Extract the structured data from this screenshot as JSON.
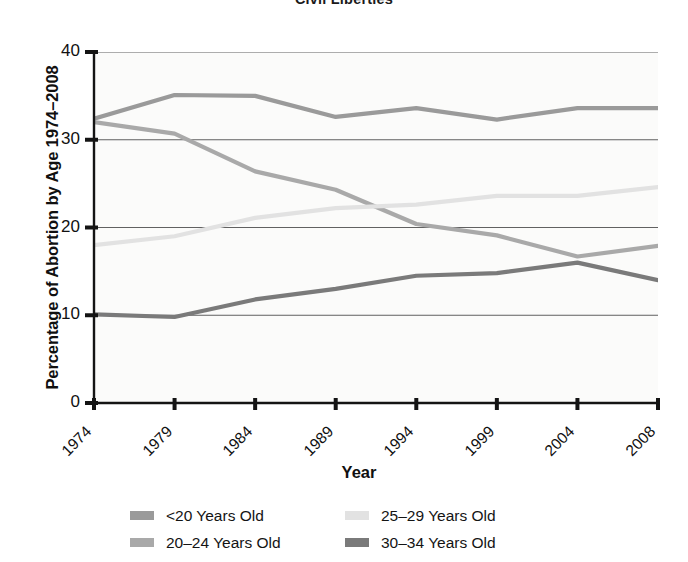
{
  "running_head": "Civil Liberties",
  "axis": {
    "y_title": "Percentage of Abortion by Age 1974–2008",
    "x_title": "Year",
    "y_ticks": [
      "0",
      "10",
      "20",
      "30",
      "40"
    ],
    "x_ticks": [
      "1974",
      "1979",
      "1984",
      "1989",
      "1994",
      "1999",
      "2004",
      "2008"
    ]
  },
  "legend": {
    "items": [
      {
        "label": "<20 Years Old",
        "color": "#9a9a9a"
      },
      {
        "label": "20–24 Years Old",
        "color": "#a9a9a9"
      },
      {
        "label": "25–29 Years Old",
        "color": "#e2e2e2"
      },
      {
        "label": "30–34 Years Old",
        "color": "#7a7a7a"
      }
    ]
  },
  "chart_data": {
    "type": "line",
    "title": "Civil Liberties",
    "xlabel": "Year",
    "ylabel": "Percentage of Abortion by Age 1974–2008",
    "x": [
      1974,
      1979,
      1984,
      1989,
      1994,
      1999,
      2004,
      2008
    ],
    "xlim": [
      1974,
      2008
    ],
    "ylim": [
      0,
      40
    ],
    "yticks": [
      0,
      10,
      20,
      30,
      40
    ],
    "grid": true,
    "grid_axis": "y",
    "legend_position": "bottom",
    "series": [
      {
        "name": "<20 Years Old",
        "color": "#9a9a9a",
        "values": [
          32.4,
          35.1,
          35.0,
          32.6,
          33.6,
          32.3,
          33.6,
          33.6
        ]
      },
      {
        "name": "20–24 Years Old",
        "color": "#a9a9a9",
        "values": [
          32.0,
          30.7,
          26.4,
          24.3,
          20.4,
          19.1,
          16.7,
          17.9
        ]
      },
      {
        "name": "25–29 Years Old",
        "color": "#e2e2e2",
        "values": [
          18.0,
          19.0,
          21.1,
          22.2,
          22.6,
          23.6,
          23.6,
          24.6
        ]
      },
      {
        "name": "30–34 Years Old",
        "color": "#7a7a7a",
        "values": [
          10.1,
          9.8,
          11.8,
          13.0,
          14.5,
          14.8,
          16.0,
          14.0
        ]
      }
    ]
  }
}
